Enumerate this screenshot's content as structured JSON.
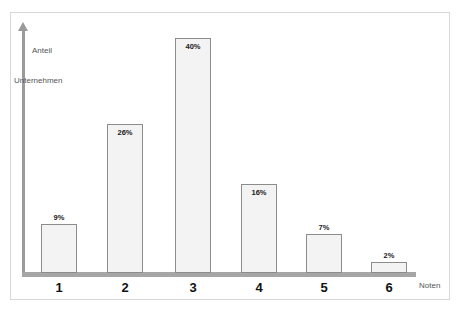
{
  "chart_data": {
    "type": "bar",
    "title": "",
    "subtitle": "",
    "xlabel": "Noten",
    "ylabel": "Anteil Unternehmen",
    "ylabel_line1": "Anteil",
    "ylabel_line2": "Unternehmen",
    "categories": [
      "1",
      "2",
      "3",
      "4",
      "5",
      "6"
    ],
    "values": [
      9,
      26,
      40,
      16,
      7,
      2
    ],
    "value_labels": [
      "9%",
      "26%",
      "40%",
      "16%",
      "7%",
      "2%"
    ],
    "label_placement": [
      "outside",
      "inside",
      "inside",
      "inside",
      "outside",
      "outside"
    ],
    "ylim": [
      0,
      44
    ],
    "grid": false,
    "legend": null,
    "legend_position": "none",
    "series": [
      {
        "name": "Anteil Unternehmen",
        "values": [
          9,
          26,
          40,
          16,
          7,
          2
        ]
      }
    ],
    "colors": {
      "bar_fill": "#f3f3f3",
      "bar_stroke": "#8c8c8c",
      "axis": "#a6a6a6",
      "axis_text": "#555555",
      "category_text": "#111111",
      "value_text": "#1a1a1a",
      "frame": "#d8d8d8",
      "background": "#ffffff"
    }
  },
  "bars": [
    {
      "category": "1",
      "value": 9,
      "label": "9%",
      "left": 41,
      "width": 36,
      "top": 224,
      "height": 49,
      "label_top": 213,
      "label_left": 41,
      "placement": "outside"
    },
    {
      "category": "2",
      "value": 26,
      "label": "26%",
      "left": 107,
      "width": 36,
      "top": 124,
      "height": 149,
      "label_top": 128,
      "label_left": 107,
      "placement": "inside"
    },
    {
      "category": "3",
      "value": 40,
      "label": "40%",
      "left": 175,
      "width": 36,
      "top": 38,
      "height": 235,
      "label_top": 42,
      "label_left": 175,
      "placement": "inside"
    },
    {
      "category": "4",
      "value": 16,
      "label": "16%",
      "left": 241,
      "width": 36,
      "top": 184,
      "height": 89,
      "label_top": 188,
      "label_left": 241,
      "placement": "inside"
    },
    {
      "category": "5",
      "value": 7,
      "label": "7%",
      "left": 306,
      "width": 36,
      "top": 234,
      "height": 39,
      "label_top": 223,
      "label_left": 306,
      "placement": "outside"
    },
    {
      "category": "6",
      "value": 2,
      "label": "2%",
      "left": 371,
      "width": 36,
      "top": 262,
      "height": 11,
      "label_top": 251,
      "label_left": 371,
      "placement": "outside"
    }
  ],
  "category_labels": [
    {
      "text": "1",
      "left": 41,
      "width": 36,
      "top": 280
    },
    {
      "text": "2",
      "left": 107,
      "width": 36,
      "top": 280
    },
    {
      "text": "3",
      "left": 175,
      "width": 36,
      "top": 280
    },
    {
      "text": "4",
      "left": 241,
      "width": 36,
      "top": 280
    },
    {
      "text": "5",
      "left": 306,
      "width": 36,
      "top": 280
    },
    {
      "text": "6",
      "left": 371,
      "width": 36,
      "top": 280
    }
  ]
}
